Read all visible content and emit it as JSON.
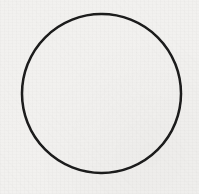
{
  "figure": {
    "type": "line-drawing",
    "medium": "scanned print on paper",
    "canvas": {
      "width": 199,
      "height": 194,
      "background_color": "#f2f1ef",
      "texture": "faint paper grain"
    },
    "shapes": [
      {
        "name": "circle-outline",
        "kind": "circle",
        "center_x": 101.5,
        "center_y": 93.5,
        "radius": 79.5,
        "stroke_color": "#1a1a1a",
        "stroke_width": 2.5,
        "fill": "none",
        "bounds": {
          "left": 22,
          "top": 14,
          "right": 181,
          "bottom": 173
        }
      }
    ],
    "labels": [],
    "annotations": [],
    "text_content": []
  }
}
